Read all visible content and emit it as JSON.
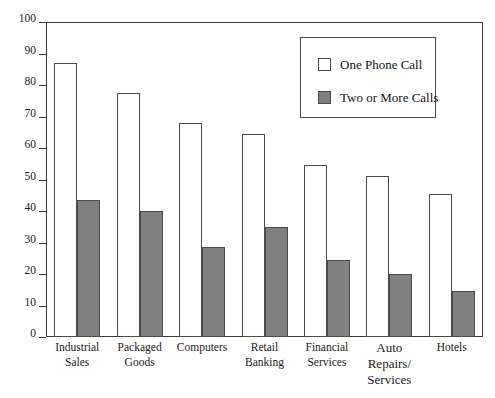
{
  "chart_data": {
    "type": "bar",
    "title": "",
    "xlabel": "",
    "ylabel": "",
    "ylim": [
      0,
      100
    ],
    "ytick_step": 10,
    "yticks": [
      0,
      10,
      20,
      30,
      40,
      50,
      60,
      70,
      80,
      90,
      100
    ],
    "grid": false,
    "legend_position": "top-right",
    "categories": [
      "Industrial\nSales",
      "Packaged\nGoods",
      "Computers",
      "Retail\nBanking",
      "Financial\nServices",
      "Auto\nRepairs/\nServices",
      "Hotels"
    ],
    "series": [
      {
        "name": "One Phone Call",
        "color": "#ffffff",
        "border": "#4a4a4a",
        "values": [
          87,
          77.5,
          68,
          64.5,
          54.5,
          51,
          45.5
        ]
      },
      {
        "name": "Two or More Calls",
        "color": "#808080",
        "border": "#4a4a4a",
        "values": [
          43.5,
          40,
          28.5,
          35,
          24.5,
          20,
          14.5
        ]
      }
    ]
  },
  "legend": {
    "items": [
      {
        "label": "One Phone Call",
        "swatch": "#ffffff"
      },
      {
        "label": "Two or More Calls",
        "swatch": "#808080"
      }
    ]
  }
}
